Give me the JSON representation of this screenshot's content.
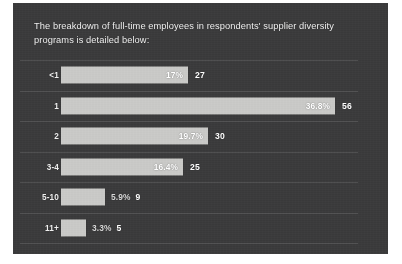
{
  "headline": "The breakdown of full-time employees in respondents' supplier diversity programs is detailed below:",
  "colors": {
    "panel_background": "#3b3b3c",
    "bar_fill": "#c9c9c7",
    "text": "#f2f2f2",
    "gridline": "#565656",
    "page_background": "#ffffff"
  },
  "chart_data": {
    "type": "bar",
    "orientation": "horizontal",
    "title": "The breakdown of full-time employees in respondents' supplier diversity programs is detailed below:",
    "xlabel": "",
    "ylabel": "",
    "grid": true,
    "legend": null,
    "categories": [
      "<1",
      "1",
      "2",
      "3-4",
      "5-10",
      "11+"
    ],
    "values": [
      17.0,
      36.8,
      19.7,
      16.4,
      5.9,
      3.3
    ],
    "counts": [
      27,
      56,
      30,
      25,
      9,
      5
    ],
    "value_unit": "%",
    "xlim": [
      0,
      40
    ],
    "bars": [
      {
        "category": "<1",
        "percent_label": "17%",
        "value": 17.0,
        "count_label": "27",
        "count": 27,
        "label_position": "inside"
      },
      {
        "category": "1",
        "percent_label": "36.8%",
        "value": 36.8,
        "count_label": "56",
        "count": 56,
        "label_position": "inside"
      },
      {
        "category": "2",
        "percent_label": "19.7%",
        "value": 19.7,
        "count_label": "30",
        "count": 30,
        "label_position": "inside"
      },
      {
        "category": "3-4",
        "percent_label": "16.4%",
        "value": 16.4,
        "count_label": "25",
        "count": 25,
        "label_position": "inside"
      },
      {
        "category": "5-10",
        "percent_label": "5.9%",
        "value": 5.9,
        "count_label": "9",
        "count": 9,
        "label_position": "outside"
      },
      {
        "category": "11+",
        "percent_label": "3.3%",
        "value": 3.3,
        "count_label": "5",
        "count": 5,
        "label_position": "outside"
      }
    ]
  }
}
